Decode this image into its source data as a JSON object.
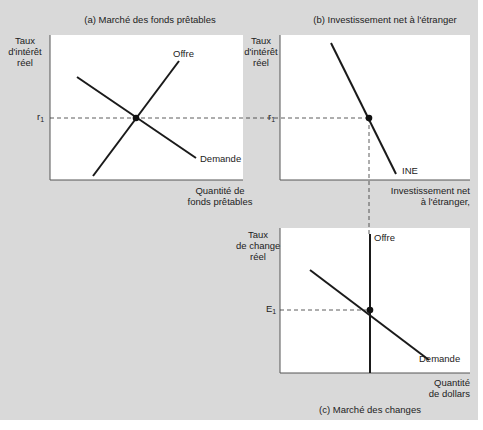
{
  "panels": {
    "a": {
      "title": "(a) Marché des fonds prêtables",
      "ylabel_lines": [
        "Taux",
        "d'intérêt",
        "réel"
      ],
      "xlabel_lines": [
        "Quantité de",
        "fonds prêtables"
      ],
      "supply_label": "Offre",
      "demand_label": "Demande",
      "eq_label": "r",
      "eq_sub": "1"
    },
    "b": {
      "title": "(b) Investissement net à l'étranger",
      "ylabel_lines": [
        "Taux",
        "d'intérêt",
        "réel"
      ],
      "xlabel_lines": [
        "Investissement net",
        "à l'étranger,"
      ],
      "curve_label": "INE",
      "eq_label": "r",
      "eq_sub": "1"
    },
    "c": {
      "title": "(c) Marché des changes",
      "ylabel_lines": [
        "Taux",
        "de change",
        "réel"
      ],
      "xlabel_lines": [
        "Quantité",
        "de dollars"
      ],
      "supply_label": "Offre",
      "demand_label": "Demande",
      "eq_label": "E",
      "eq_sub": "1"
    }
  },
  "colors": {
    "background": "#d9d9d9",
    "panel": "#ffffff",
    "line": "#1a1a1a",
    "axis": "#555555"
  }
}
